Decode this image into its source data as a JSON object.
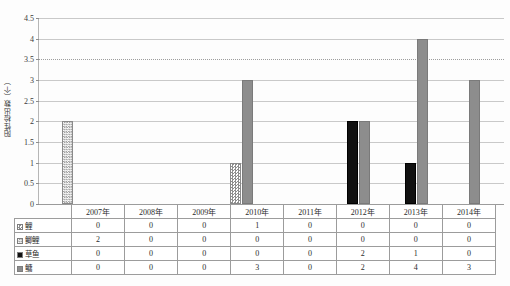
{
  "chart_data": {
    "type": "bar",
    "title": "",
    "xlabel": "",
    "ylabel": "阳性检出数（个）",
    "ylim": [
      0,
      4.5
    ],
    "grid": true,
    "legend_position": "table-row-headers",
    "categories": [
      "2007年",
      "2008年",
      "2009年",
      "2010年",
      "2011年",
      "2012年",
      "2013年",
      "2014年"
    ],
    "yticks": [
      "0",
      "0.5",
      "1",
      "1.5",
      "2",
      "2.5",
      "3",
      "3.5",
      "4",
      "4.5"
    ],
    "series": [
      {
        "name": "鲤",
        "marker": "check",
        "color": "#8f8f8f",
        "values": [
          0,
          0,
          0,
          1,
          0,
          0,
          0,
          0
        ]
      },
      {
        "name": "鲫鲤",
        "marker": "check2",
        "color": "#9a9a9a",
        "values": [
          2,
          0,
          0,
          0,
          0,
          0,
          0,
          0
        ]
      },
      {
        "name": "草鱼",
        "marker": "black",
        "color": "#111111",
        "values": [
          0,
          0,
          0,
          0,
          0,
          2,
          1,
          0
        ]
      },
      {
        "name": "鳙",
        "marker": "gray",
        "color": "#8d8d8d",
        "values": [
          0,
          0,
          0,
          3,
          0,
          2,
          4,
          3
        ]
      }
    ]
  },
  "table": {
    "header": [
      "",
      "2007年",
      "2008年",
      "2009年",
      "2010年",
      "2011年",
      "2012年",
      "2013年",
      "2014年"
    ],
    "rows": [
      {
        "label": "鲤",
        "marker": "check",
        "values": [
          "0",
          "0",
          "0",
          "1",
          "0",
          "0",
          "0",
          "0"
        ]
      },
      {
        "label": "鲫鲤",
        "marker": "check2",
        "values": [
          "2",
          "0",
          "0",
          "0",
          "0",
          "0",
          "0",
          "0"
        ]
      },
      {
        "label": "草鱼",
        "marker": "black",
        "values": [
          "0",
          "0",
          "0",
          "0",
          "0",
          "2",
          "1",
          "0"
        ]
      },
      {
        "label": "鳙",
        "marker": "gray",
        "values": [
          "0",
          "0",
          "0",
          "3",
          "0",
          "2",
          "4",
          "3"
        ]
      }
    ]
  }
}
